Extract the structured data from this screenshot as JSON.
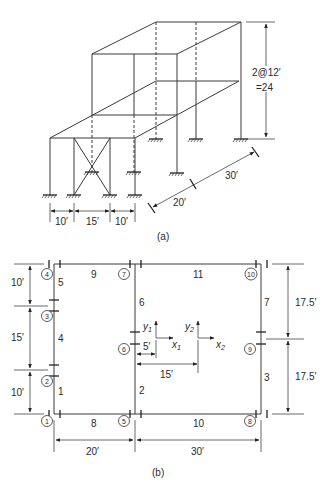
{
  "figure_a": {
    "caption": "(a)",
    "height_dim": {
      "line1": "2@12′",
      "line2": "=24"
    },
    "depth_dims": [
      "20′",
      "30′"
    ],
    "width_dims": [
      "10′",
      "15′",
      "10′"
    ]
  },
  "figure_b": {
    "caption": "(b)",
    "joints": [
      "1",
      "2",
      "3",
      "4",
      "5",
      "6",
      "7",
      "8",
      "9",
      "10"
    ],
    "members": [
      "1",
      "2",
      "3",
      "4",
      "5",
      "6",
      "7",
      "8",
      "9",
      "10",
      "11"
    ],
    "left_dims": [
      "10′",
      "15′",
      "10′"
    ],
    "right_dims": [
      "17.5′",
      "17.5′"
    ],
    "bottom_dims": [
      "20′",
      "30′"
    ],
    "offset_dims": [
      "5′",
      "15′"
    ],
    "axes": {
      "y1": "y",
      "y1_sub": "1",
      "x1": "x",
      "x1_sub": "1",
      "y2": "y",
      "y2_sub": "2",
      "x2": "x",
      "x2_sub": "2"
    }
  }
}
